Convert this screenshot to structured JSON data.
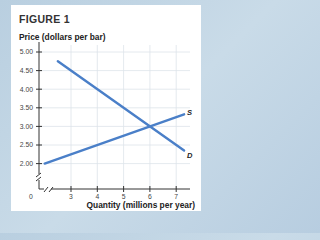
{
  "chart_data": {
    "type": "line",
    "title": "FIGURE 1",
    "ylabel": "Price (dollars per bar)",
    "xlabel": "Quantity (millions per year)",
    "xlim": [
      2,
      7.4
    ],
    "ylim": [
      1.7,
      5.1
    ],
    "x_ticks": [
      3,
      4,
      5,
      6,
      7
    ],
    "x_tick_labels": [
      "3",
      "4",
      "5",
      "6",
      "7"
    ],
    "origin_label": "0",
    "y_ticks": [
      2.0,
      2.5,
      3.0,
      3.5,
      4.0,
      4.5,
      5.0
    ],
    "y_tick_labels": [
      "2.00",
      "2.50",
      "3.00",
      "3.50",
      "4.00",
      "4.50",
      "5.00"
    ],
    "grid": true,
    "axis_break": true,
    "series": [
      {
        "name": "S",
        "label": "S",
        "color": "#4a7fc8",
        "x": [
          2.0,
          7.3
        ],
        "y": [
          2.0,
          3.325
        ]
      },
      {
        "name": "D",
        "label": "D",
        "color": "#4a7fc8",
        "x": [
          2.5,
          7.3
        ],
        "y": [
          4.75,
          2.35
        ]
      }
    ]
  }
}
